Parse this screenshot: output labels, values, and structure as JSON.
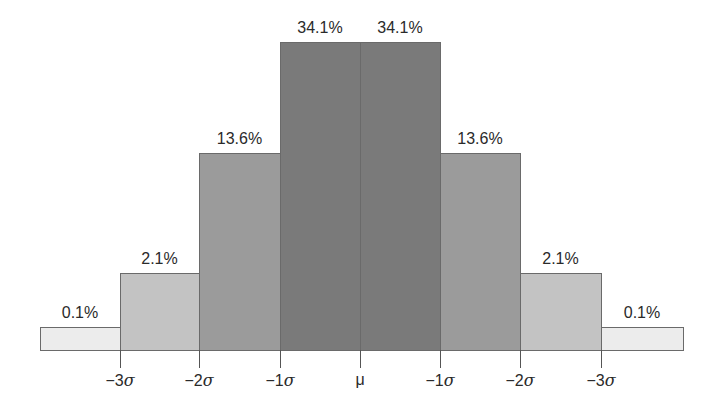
{
  "chart_data": {
    "type": "bar",
    "title": "",
    "xlabel": "",
    "ylabel": "",
    "categories": [
      "<-3σ",
      "-3σ to -2σ",
      "-2σ to -1σ",
      "-1σ to μ",
      "μ to +1σ",
      "+1σ to +2σ",
      "+2σ to +3σ",
      ">+3σ"
    ],
    "values": [
      0.1,
      2.1,
      13.6,
      34.1,
      34.1,
      13.6,
      2.1,
      0.1
    ],
    "value_labels": [
      "0.1%",
      "2.1%",
      "13.6%",
      "34.1%",
      "34.1%",
      "13.6%",
      "2.1%",
      "0.1%"
    ],
    "tick_labels": [
      "−3σ",
      "−2σ",
      "−1σ",
      "μ",
      "−1σ",
      "−2σ",
      "−3σ"
    ],
    "bar_colors": [
      "#ececec",
      "#c3c3c3",
      "#9b9b9b",
      "#7a7a7a",
      "#7a7a7a",
      "#9b9b9b",
      "#c3c3c3",
      "#ececec"
    ],
    "grid": false,
    "legend": null
  }
}
